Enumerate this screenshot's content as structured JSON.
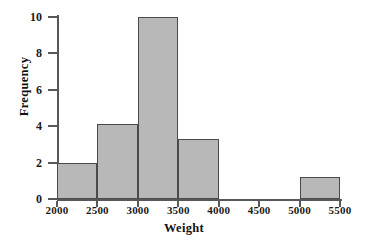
{
  "chart_data": {
    "type": "bar",
    "title": "",
    "xlabel": "Weight",
    "ylabel": "Frequency",
    "xlim": [
      2000,
      5500
    ],
    "ylim": [
      0,
      10
    ],
    "grid": false,
    "legend": null,
    "bin_width": 500,
    "x_ticks": [
      "2000",
      "2500",
      "3000",
      "3500",
      "4000",
      "4500",
      "5000",
      "5500"
    ],
    "y_ticks": [
      "0",
      "2",
      "4",
      "6",
      "8",
      "10"
    ],
    "bar_color": "#b8b8b8",
    "bar_edge_color": "#4a4a4c",
    "axis_color": "#58585a",
    "bins": [
      {
        "start": 2000,
        "end": 2500,
        "value": 2
      },
      {
        "start": 2500,
        "end": 3000,
        "value": 4.1
      },
      {
        "start": 3000,
        "end": 3500,
        "value": 10
      },
      {
        "start": 3500,
        "end": 4000,
        "value": 3.3
      },
      {
        "start": 4000,
        "end": 4500,
        "value": 0
      },
      {
        "start": 4500,
        "end": 5000,
        "value": 0
      },
      {
        "start": 5000,
        "end": 5500,
        "value": 1.2
      }
    ],
    "categories": [
      "2000-2500",
      "2500-3000",
      "3000-3500",
      "3500-4000",
      "4000-4500",
      "4500-5000",
      "5000-5500"
    ],
    "values": [
      2,
      4.1,
      10,
      3.3,
      0,
      0,
      1.2
    ]
  }
}
